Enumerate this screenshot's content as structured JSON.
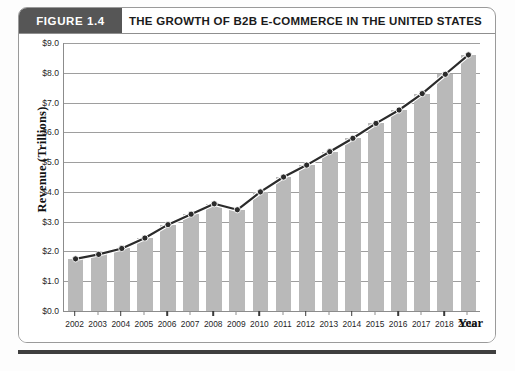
{
  "figure": {
    "badge_label": "FIGURE 1.4",
    "title": "THE GROWTH OF B2B E-COMMERCE IN THE UNITED STATES"
  },
  "axis": {
    "y_title": "Revenue (Trillions)",
    "x_title": "Year"
  },
  "chart_data": {
    "type": "bar",
    "title": "THE GROWTH OF B2B E-COMMERCE IN THE UNITED STATES",
    "xlabel": "Year",
    "ylabel": "Revenue (Trillions)",
    "ylim": [
      0.0,
      9.0
    ],
    "ytick_step": 1.0,
    "ytick_labels": [
      "$0.0",
      "$1.0",
      "$2.0",
      "$3.0",
      "$4.0",
      "$5.0",
      "$6.0",
      "$7.0",
      "$8.0",
      "$9.0"
    ],
    "ytick_values": [
      0.0,
      1.0,
      2.0,
      3.0,
      4.0,
      5.0,
      6.0,
      7.0,
      8.0,
      9.0
    ],
    "grid": true,
    "legend": null,
    "categories": [
      "2002",
      "2003",
      "2004",
      "2005",
      "2006",
      "2007",
      "2008",
      "2009",
      "2010",
      "2011",
      "2012",
      "2013",
      "2014",
      "2015",
      "2016",
      "2017",
      "2018",
      "2019"
    ],
    "values": [
      1.75,
      1.9,
      2.1,
      2.45,
      2.9,
      3.25,
      3.6,
      3.4,
      4.0,
      4.5,
      4.9,
      5.35,
      5.8,
      6.3,
      6.75,
      7.3,
      7.95,
      8.6
    ],
    "series": [
      {
        "name": "Revenue",
        "render": "bars-with-overlaid-line",
        "values": [
          1.75,
          1.9,
          2.1,
          2.45,
          2.9,
          3.25,
          3.6,
          3.4,
          4.0,
          4.5,
          4.9,
          5.35,
          5.8,
          6.3,
          6.75,
          7.3,
          7.95,
          8.6
        ]
      }
    ]
  },
  "colors": {
    "badge_background": "#565656",
    "badge_text": "#ffffff",
    "bar_fill": "#b9b9b9",
    "line_stroke": "#2b2b2b",
    "marker_fill": "#2b2b2b",
    "gridline": "#9e9e9e",
    "axis": "#8c8c8c",
    "frame_border": "#9a9a9a",
    "bottom_rule": "#3f3f3f",
    "page_background": "#ffffff"
  }
}
